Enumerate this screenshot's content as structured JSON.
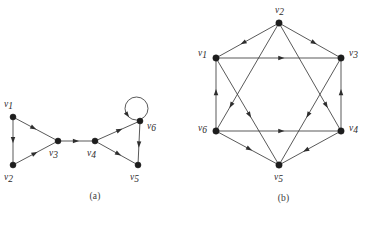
{
  "figure": {
    "background_color": "#ffffff",
    "ink_color": "#2e2e2e",
    "width": 377,
    "height": 226
  },
  "panels": [
    {
      "id": "a",
      "caption": "(a)",
      "description": "Digraph with six vertices: two triangles joined by a bridge, plus a self-loop at v6",
      "vertices": [
        {
          "id": "v1",
          "label": "v",
          "subscript": "1",
          "x": 13,
          "y": 117,
          "label_x": 4,
          "label_y": 107,
          "radius": 3.0
        },
        {
          "id": "v2",
          "label": "v",
          "subscript": "2",
          "x": 13,
          "y": 165,
          "label_x": 4,
          "label_y": 180,
          "radius": 3.0
        },
        {
          "id": "v3",
          "label": "v",
          "subscript": "3",
          "x": 58,
          "y": 141,
          "label_x": 49,
          "label_y": 156,
          "radius": 3.0
        },
        {
          "id": "v4",
          "label": "v",
          "subscript": "4",
          "x": 95,
          "y": 141,
          "label_x": 87,
          "label_y": 156,
          "radius": 3.0
        },
        {
          "id": "v5",
          "label": "v",
          "subscript": "5",
          "x": 138,
          "y": 165,
          "label_x": 130,
          "label_y": 180,
          "radius": 3.0
        },
        {
          "id": "v6",
          "label": "v",
          "subscript": "6",
          "x": 140,
          "y": 121,
          "label_x": 147,
          "label_y": 129,
          "radius": 3.0
        }
      ],
      "edges": [
        {
          "from": "v1",
          "to": "v2",
          "kind": "straight",
          "arrow_at": 0.55
        },
        {
          "from": "v1",
          "to": "v3",
          "kind": "straight",
          "arrow_at": 0.52
        },
        {
          "from": "v2",
          "to": "v3",
          "kind": "straight",
          "arrow_at": 0.55
        },
        {
          "from": "v3",
          "to": "v4",
          "kind": "straight",
          "arrow_at": 0.58
        },
        {
          "from": "v4",
          "to": "v6",
          "kind": "straight",
          "arrow_at": 0.62
        },
        {
          "from": "v4",
          "to": "v5",
          "kind": "straight",
          "arrow_at": 0.62
        },
        {
          "from": "v6",
          "to": "v5",
          "kind": "straight",
          "arrow_at": 0.62
        },
        {
          "from": "v6",
          "to": "v6",
          "kind": "self-loop",
          "loop_direction": "up-left",
          "arrow_at": 0.9
        }
      ]
    },
    {
      "id": "b",
      "caption": "(b)",
      "description": "Digraph on six vertices arranged as a hexagon with both inscribed triangles (Star of David), every edge directed",
      "vertices": [
        {
          "id": "v1",
          "label": "v",
          "subscript": "1",
          "x": 26,
          "y": 58,
          "label_x": 8,
          "label_y": 56,
          "radius": 3.2
        },
        {
          "id": "v2",
          "label": "v",
          "subscript": "2",
          "x": 89,
          "y": 23,
          "label_x": 85,
          "label_y": 13,
          "radius": 3.2
        },
        {
          "id": "v3",
          "label": "v",
          "subscript": "3",
          "x": 151,
          "y": 58,
          "label_x": 159,
          "label_y": 56,
          "radius": 3.2
        },
        {
          "id": "v4",
          "label": "v",
          "subscript": "4",
          "x": 151,
          "y": 131,
          "label_x": 159,
          "label_y": 131,
          "radius": 3.2
        },
        {
          "id": "v5",
          "label": "v",
          "subscript": "5",
          "x": 89,
          "y": 165,
          "label_x": 84,
          "label_y": 180,
          "radius": 3.2
        },
        {
          "id": "v6",
          "label": "v",
          "subscript": "6",
          "x": 26,
          "y": 131,
          "label_x": 8,
          "label_y": 131,
          "radius": 3.2
        }
      ],
      "edges": [
        {
          "from": "v2",
          "to": "v1",
          "kind": "straight",
          "arrow_at": 0.62
        },
        {
          "from": "v2",
          "to": "v3",
          "kind": "straight",
          "arrow_at": 0.62
        },
        {
          "from": "v1",
          "to": "v3",
          "kind": "straight",
          "arrow_at": 0.55
        },
        {
          "from": "v6",
          "to": "v1",
          "kind": "straight",
          "arrow_at": 0.58
        },
        {
          "from": "v4",
          "to": "v3",
          "kind": "straight",
          "arrow_at": 0.58
        },
        {
          "from": "v6",
          "to": "v4",
          "kind": "straight",
          "arrow_at": 0.55
        },
        {
          "from": "v6",
          "to": "v5",
          "kind": "straight",
          "arrow_at": 0.58
        },
        {
          "from": "v4",
          "to": "v5",
          "kind": "straight",
          "arrow_at": 0.62
        },
        {
          "from": "v2",
          "to": "v6",
          "kind": "straight",
          "arrow_at": 0.8
        },
        {
          "from": "v2",
          "to": "v4",
          "kind": "straight",
          "arrow_at": 0.8
        },
        {
          "from": "v1",
          "to": "v5",
          "kind": "straight",
          "arrow_at": 0.56
        },
        {
          "from": "v3",
          "to": "v5",
          "kind": "straight",
          "arrow_at": 0.56
        }
      ]
    }
  ]
}
